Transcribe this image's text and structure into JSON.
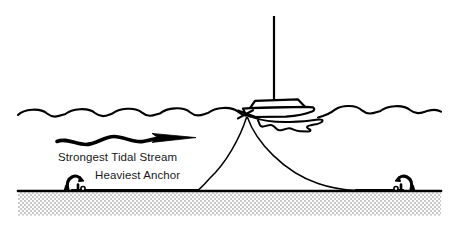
{
  "diagram": {
    "background_color": "#ffffff",
    "ink_color": "#000000",
    "seabed_fill_color": "#d9d9d9",
    "labels": {
      "tidal_stream": "Strongest Tidal Stream",
      "heaviest_anchor": "Heaviest Anchor"
    },
    "elements": {
      "mast": "mast",
      "vessel": "motor-cruiser",
      "water_surface": "wave-line",
      "flow_arrow": "wavy-arrow-pointing-right",
      "seabed_line": "seabed",
      "seabed_fill": "seabed-sediment",
      "anchor_left": "plough-anchor-left",
      "anchor_right": "plough-anchor-right",
      "rode_left": "anchor-cable-left",
      "rode_right": "anchor-cable-right"
    },
    "geometry": {
      "waterline_y": 115,
      "seabed_y": 191,
      "bow_x": 247,
      "bow_y": 116,
      "mast_top_y": 16,
      "mast_x": 274,
      "wave_start_x": 18,
      "wave_end_x": 441,
      "wave_period": 47,
      "rode_left_touchdown_x": 198,
      "rode_right_touchdown_x": 356,
      "anchor_left_x": 72,
      "anchor_right_x": 403
    }
  }
}
